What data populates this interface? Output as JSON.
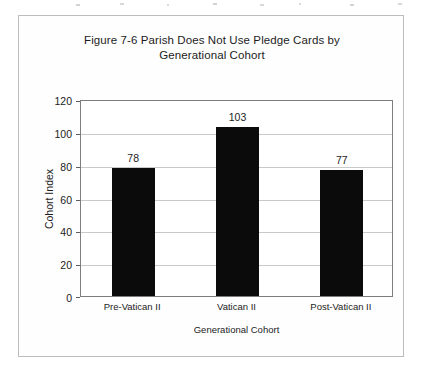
{
  "figure": {
    "frame_border_color": "#bdbdbd",
    "background": "#fefefe"
  },
  "chart_data": {
    "type": "bar",
    "title": "Figure 7-6 Parish Does Not Use Pledge Cards by Generational Cohort",
    "title_line1": "Figure 7-6 Parish Does Not Use Pledge Cards by",
    "title_line2": "Generational Cohort",
    "categories": [
      "Pre-Vatican II",
      "Vatican II",
      "Post-Vatican II"
    ],
    "values": [
      78,
      103,
      77
    ],
    "data_labels": [
      "78",
      "103",
      "77"
    ],
    "xlabel": "Generational Cohort",
    "ylabel": "Cohort Index",
    "ylim": [
      0,
      120
    ],
    "ytick_values": [
      0,
      20,
      40,
      60,
      80,
      100,
      120
    ],
    "ytick_labels": [
      "0",
      "20",
      "40",
      "60",
      "80",
      "100",
      "120"
    ],
    "grid": true,
    "legend": false,
    "bar_color": "#0b0b0b",
    "gridline_color": "#c9c9c9",
    "axis_color": "#7d7d7d"
  }
}
